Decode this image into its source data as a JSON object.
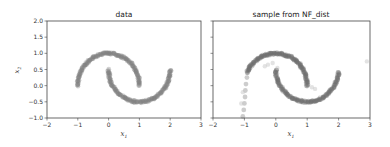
{
  "chart_data": [
    {
      "type": "scatter",
      "title": "data",
      "xlabel": "x1",
      "ylabel": "x2",
      "xlim": [
        -2,
        3
      ],
      "ylim": [
        -1,
        2
      ],
      "xticks": [
        "−2",
        "−1",
        "0",
        "1",
        "2",
        "3"
      ],
      "yticks": [
        "−1.0",
        "−0.5",
        "0.0",
        "0.5",
        "1.0",
        "1.5",
        "2.0"
      ],
      "grid": false,
      "series": [
        {
          "name": "upper moon",
          "description": "half circle centered (0,0), radius 1, angles 0..pi",
          "center": [
            0,
            0
          ],
          "radius": 1,
          "theta_range": [
            0,
            3.14159
          ],
          "color": "#808080"
        },
        {
          "name": "lower moon",
          "description": "half circle centered (1,0.5), radius 1, angles pi..2pi",
          "center": [
            1,
            0.5
          ],
          "radius": 1,
          "theta_range": [
            3.14159,
            6.28318
          ],
          "color": "#808080"
        }
      ]
    },
    {
      "type": "scatter",
      "title": "sample from NF_dist",
      "xlabel": "x1",
      "ylabel": "",
      "xlim": [
        -2,
        3
      ],
      "ylim": [
        -1,
        2
      ],
      "xticks": [
        "−2",
        "−1",
        "0",
        "1",
        "2",
        "3"
      ],
      "yticks": [
        "",
        "",
        "",
        "",
        "",
        "",
        ""
      ],
      "grid": false,
      "series": [
        {
          "name": "upper moon (sampled)",
          "center": [
            0,
            0
          ],
          "radius": 1,
          "theta_range": [
            0,
            2.7
          ],
          "color": "#707070"
        },
        {
          "name": "left tail (sampled)",
          "points": [
            [
              -0.92,
              0.25
            ],
            [
              -0.95,
              0.05
            ],
            [
              -0.97,
              -0.15
            ],
            [
              -0.98,
              -0.35
            ],
            [
              -1.0,
              -0.55
            ],
            [
              -1.02,
              -0.75
            ],
            [
              -1.05,
              -0.95
            ],
            [
              -0.9,
              0.4
            ],
            [
              -0.85,
              0.5
            ]
          ],
          "color": "#707070"
        },
        {
          "name": "lower moon (sampled)",
          "center": [
            1,
            0.5
          ],
          "radius": 1,
          "theta_range": [
            3.14159,
            6.2
          ],
          "color": "#707070"
        },
        {
          "name": "outliers",
          "points": [
            [
              -0.35,
              0.6
            ],
            [
              -0.25,
              0.65
            ],
            [
              -0.1,
              0.7
            ],
            [
              1.15,
              -0.05
            ],
            [
              1.25,
              -0.1
            ],
            [
              2.9,
              0.75
            ],
            [
              -1.1,
              -0.55
            ],
            [
              -1.05,
              -0.2
            ],
            [
              0.05,
              0.55
            ]
          ],
          "color": "#c8c8c8"
        }
      ]
    }
  ]
}
